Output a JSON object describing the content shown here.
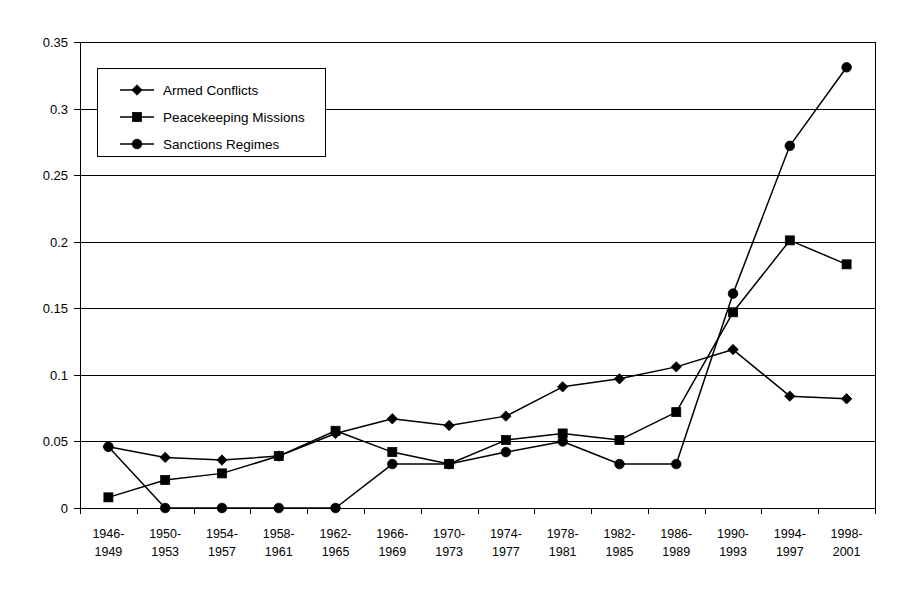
{
  "chart_data": {
    "type": "line",
    "title": "",
    "subtitle": "",
    "xlabel": "",
    "ylabel": "",
    "grid": true,
    "legend_position": "top-left-inside",
    "ylim": [
      0,
      0.35
    ],
    "yticks": [
      "0",
      "0.05",
      "0.1",
      "0.15",
      "0.2",
      "0.25",
      "0.3",
      "0.35"
    ],
    "ytick_values": [
      0,
      0.05,
      0.1,
      0.15,
      0.2,
      0.25,
      0.3,
      0.35
    ],
    "categories": [
      "1946-\n1949",
      "1950-\n1953",
      "1954-\n1957",
      "1958-\n1961",
      "1962-\n1965",
      "1966-\n1969",
      "1970-\n1973",
      "1974-\n1977",
      "1978-\n1981",
      "1982-\n1985",
      "1986-\n1989",
      "1990-\n1993",
      "1994-\n1997",
      "1998-\n2001"
    ],
    "category_lines": [
      [
        "1946-",
        "1949"
      ],
      [
        "1950-",
        "1953"
      ],
      [
        "1954-",
        "1957"
      ],
      [
        "1958-",
        "1961"
      ],
      [
        "1962-",
        "1965"
      ],
      [
        "1966-",
        "1969"
      ],
      [
        "1970-",
        "1973"
      ],
      [
        "1974-",
        "1977"
      ],
      [
        "1978-",
        "1981"
      ],
      [
        "1982-",
        "1985"
      ],
      [
        "1986-",
        "1989"
      ],
      [
        "1990-",
        "1993"
      ],
      [
        "1994-",
        "1997"
      ],
      [
        "1998-",
        "2001"
      ]
    ],
    "series": [
      {
        "name": "Armed  Conflicts",
        "marker": "diamond",
        "color": "#000000",
        "values": [
          0.046,
          0.038,
          0.036,
          0.039,
          0.056,
          0.067,
          0.062,
          0.069,
          0.091,
          0.097,
          0.106,
          0.119,
          0.084,
          0.082
        ]
      },
      {
        "name": "Peacekeeping Missions",
        "marker": "square",
        "color": "#000000",
        "values": [
          0.008,
          0.021,
          0.026,
          0.039,
          0.058,
          0.042,
          0.033,
          0.051,
          0.056,
          0.051,
          0.072,
          0.147,
          0.201,
          0.183
        ]
      },
      {
        "name": "Sanctions Regimes",
        "marker": "circle",
        "color": "#000000",
        "values": [
          0.046,
          0.0,
          0.0,
          0.0,
          0.0,
          0.033,
          0.033,
          0.042,
          0.05,
          0.033,
          0.033,
          0.161,
          0.272,
          0.331
        ]
      }
    ]
  },
  "legend": {
    "entries": [
      {
        "label": "Armed  Conflicts",
        "marker": "diamond"
      },
      {
        "label": "Peacekeeping Missions",
        "marker": "square"
      },
      {
        "label": "Sanctions Regimes",
        "marker": "circle"
      }
    ]
  }
}
